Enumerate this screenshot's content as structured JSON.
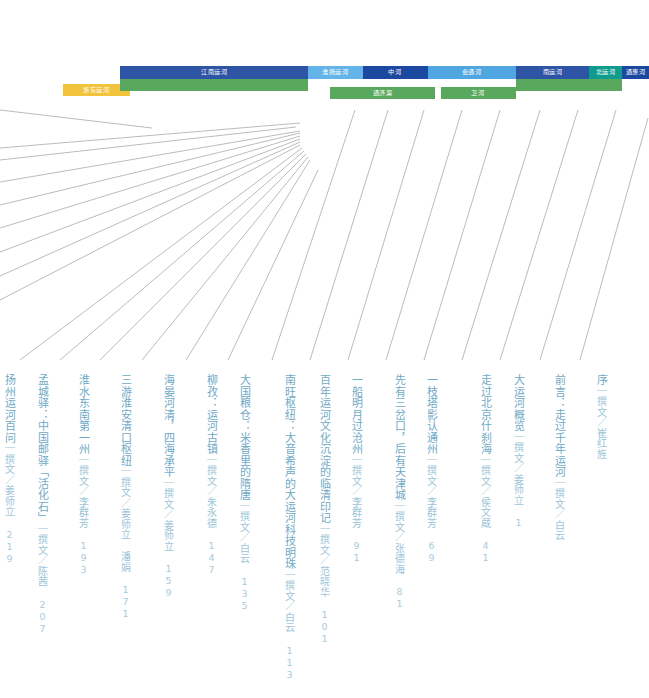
{
  "canal_segments": {
    "row_top": [
      {
        "name": "jiangnan-canal",
        "label": "江南运河",
        "color": "#2e55a5",
        "x": 120,
        "y": 66,
        "w": 188,
        "h": 13
      },
      {
        "name": "huaiyang-canal",
        "label": "淮扬运河",
        "color": "#63b4e8",
        "x": 308,
        "y": 66,
        "w": 55,
        "h": 13
      },
      {
        "name": "zhonghe-canal",
        "label": "中河",
        "color": "#1c49a0",
        "x": 363,
        "y": 66,
        "w": 65,
        "h": 13
      },
      {
        "name": "huitong-canal",
        "label": "会通河",
        "color": "#4fa6e0",
        "x": 428,
        "y": 66,
        "w": 88,
        "h": 13
      },
      {
        "name": "nanyun-canal",
        "label": "南运河",
        "color": "#2e55a5",
        "x": 516,
        "y": 66,
        "w": 73,
        "h": 13
      },
      {
        "name": "beiyun-canal",
        "label": "北运河",
        "color": "#0f9c8f",
        "x": 589,
        "y": 66,
        "w": 33,
        "h": 13
      },
      {
        "name": "tonghui-canal",
        "label": "通惠河",
        "color": "#1c49a0",
        "x": 622,
        "y": 66,
        "w": 27,
        "h": 13
      }
    ],
    "row_bottom": [
      {
        "name": "zhedong-canal",
        "label": "浙东运河",
        "color": "#f2c33d",
        "x": 63,
        "y": 84,
        "w": 67,
        "h": 12
      },
      {
        "name": "jiangnan-canal-green",
        "label": "",
        "color": "#59a85d",
        "x": 120,
        "y": 79,
        "w": 188,
        "h": 12
      },
      {
        "name": "tongji-channel",
        "label": "通济渠",
        "color": "#59a85d",
        "x": 330,
        "y": 87,
        "w": 105,
        "h": 12
      },
      {
        "name": "weihe-channel",
        "label": "卫河",
        "color": "#59a85d",
        "x": 441,
        "y": 87,
        "w": 75,
        "h": 12
      },
      {
        "name": "nanyun-green",
        "label": "",
        "color": "#59a85d",
        "x": 516,
        "y": 79,
        "w": 106,
        "h": 12
      }
    ]
  },
  "toc": {
    "entries": [
      {
        "name": "toc-xu",
        "title": "序",
        "byline": "｜撰文／崔红旌",
        "page": "",
        "x": 594,
        "y": 374
      },
      {
        "name": "toc-qianyan",
        "title": "前言：走过千年运河",
        "byline": "｜撰文／白云",
        "page": "",
        "x": 552,
        "y": 374
      },
      {
        "name": "toc-dayunhe-gailan",
        "title": "大运河概览",
        "byline": "｜撰文／姜师立",
        "page": "1",
        "x": 511,
        "y": 374
      },
      {
        "name": "toc-shichahai",
        "title": "走过北京什刹海",
        "byline": "｜撰文／侯文蔵",
        "page": "41",
        "x": 478,
        "y": 374
      },
      {
        "name": "toc-tongzhou",
        "title": "一枝塔影认通州",
        "byline": "｜撰文／李群芳",
        "page": "69",
        "x": 424,
        "y": 374
      },
      {
        "name": "toc-tianjin",
        "title": "先有三岔口，后有天津城",
        "byline": "｜撰文／张德海",
        "page": "81",
        "x": 392,
        "y": 374
      },
      {
        "name": "toc-cangzhou",
        "title": "一船明月过沧州",
        "byline": "｜撰文／李群芳",
        "page": "91",
        "x": 349,
        "y": 374
      },
      {
        "name": "toc-linqing",
        "title": "百年运河文化沉淀的临清印记",
        "byline": "｜撰文／范晓华",
        "page": "101",
        "x": 317,
        "y": 374
      },
      {
        "name": "toc-nanwang",
        "title": "南旺枢纽：大音希声的大运河科技明珠",
        "byline": "｜撰文／白云",
        "page": "113",
        "x": 282,
        "y": 374
      },
      {
        "name": "toc-dalianggang",
        "title": "大国粮仓：米香里的隋唐",
        "byline": "｜撰文／白云",
        "page": "135",
        "x": 237,
        "y": 374
      },
      {
        "name": "toc-liuzi",
        "title": "柳孜：运河古镇",
        "byline": "｜撰文／朱永德",
        "page": "147",
        "x": 204,
        "y": 374
      },
      {
        "name": "toc-haiyanheqing",
        "title": "海晏河清，四海承平",
        "byline": "｜撰文／姜师立",
        "page": "159",
        "x": 161,
        "y": 374
      },
      {
        "name": "toc-huaian",
        "title": "三游淮安清口枢纽",
        "byline": "｜撰文／姜师立 潘娟",
        "page": "171",
        "x": 118,
        "y": 374
      },
      {
        "name": "toc-huaishui",
        "title": "淮水东南第一州",
        "byline": "｜撰文／李群芳",
        "page": "193",
        "x": 76,
        "y": 374
      },
      {
        "name": "toc-mengchengyi",
        "title": "孟城驿：中国邮驿「活化石」",
        "byline": "｜撰文／陈茜",
        "page": "207",
        "x": 35,
        "y": 374
      },
      {
        "name": "toc-cut-left",
        "title": "扬州运河百问",
        "byline": "｜撰文／姜师立",
        "page": "219",
        "x": 2,
        "y": 374
      }
    ]
  },
  "leader_lines": {
    "color": "#8a8f94",
    "width": 0.6,
    "lines": [
      {
        "x1": 0,
        "y1": 110,
        "x2": 152,
        "y2": 128
      },
      {
        "x1": 0,
        "y1": 148,
        "x2": 300,
        "y2": 123
      },
      {
        "x1": 0,
        "y1": 160,
        "x2": 296,
        "y2": 127
      },
      {
        "x1": 0,
        "y1": 182,
        "x2": 300,
        "y2": 131
      },
      {
        "x1": 0,
        "y1": 205,
        "x2": 300,
        "y2": 133
      },
      {
        "x1": 0,
        "y1": 228,
        "x2": 300,
        "y2": 136
      },
      {
        "x1": 0,
        "y1": 252,
        "x2": 300,
        "y2": 139
      },
      {
        "x1": 0,
        "y1": 276,
        "x2": 300,
        "y2": 142
      },
      {
        "x1": 0,
        "y1": 300,
        "x2": 300,
        "y2": 145
      },
      {
        "x1": 20,
        "y1": 360,
        "x2": 302,
        "y2": 148
      },
      {
        "x1": 60,
        "y1": 360,
        "x2": 304,
        "y2": 151
      },
      {
        "x1": 100,
        "y1": 360,
        "x2": 306,
        "y2": 154
      },
      {
        "x1": 142,
        "y1": 360,
        "x2": 308,
        "y2": 157
      },
      {
        "x1": 186,
        "y1": 360,
        "x2": 310,
        "y2": 160
      },
      {
        "x1": 228,
        "y1": 360,
        "x2": 318,
        "y2": 170
      },
      {
        "x1": 272,
        "y1": 360,
        "x2": 355,
        "y2": 110
      },
      {
        "x1": 310,
        "y1": 360,
        "x2": 388,
        "y2": 110
      },
      {
        "x1": 348,
        "y1": 360,
        "x2": 424,
        "y2": 110
      },
      {
        "x1": 386,
        "y1": 360,
        "x2": 462,
        "y2": 110
      },
      {
        "x1": 424,
        "y1": 360,
        "x2": 500,
        "y2": 110
      },
      {
        "x1": 462,
        "y1": 360,
        "x2": 540,
        "y2": 110
      },
      {
        "x1": 500,
        "y1": 360,
        "x2": 578,
        "y2": 110
      },
      {
        "x1": 540,
        "y1": 360,
        "x2": 616,
        "y2": 110
      },
      {
        "x1": 580,
        "y1": 360,
        "x2": 648,
        "y2": 118
      }
    ]
  }
}
